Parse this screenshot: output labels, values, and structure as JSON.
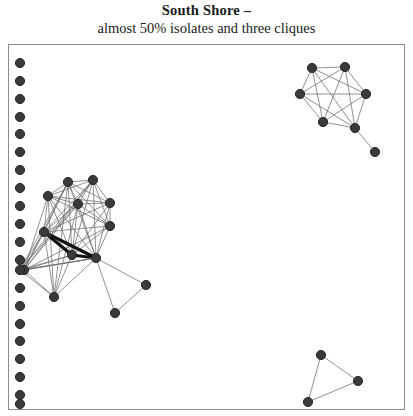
{
  "title": {
    "main": "South Shore –",
    "sub": "almost 50% isolates and three cliques"
  },
  "style": {
    "node_fill": "#3a3a3a",
    "node_stroke": "#1c1c1c",
    "edge_color": "#6d6d6d",
    "edge_heavy_color": "#121212",
    "frame_color": "#8d8d8d",
    "background": "#ffffff",
    "node_radius": 4.6
  },
  "chart_data": {
    "type": "scatter",
    "title": "South Shore – almost 50% isolates and three cliques",
    "xlabel": "",
    "ylabel": "",
    "grid": false,
    "legend": "none",
    "xlim": [
      8,
      405
    ],
    "ylim": [
      44,
      410
    ],
    "groups": [
      {
        "name": "isolates",
        "count": 20
      },
      {
        "name": "main-cluster",
        "count": 14
      },
      {
        "name": "top-right-clique",
        "count": 7
      },
      {
        "name": "bottom-right-clique",
        "count": 3
      }
    ],
    "nodes": [
      {
        "id": "i1",
        "x": 20,
        "y": 63,
        "group": "isolates"
      },
      {
        "id": "i2",
        "x": 20,
        "y": 81,
        "group": "isolates"
      },
      {
        "id": "i3",
        "x": 20,
        "y": 99,
        "group": "isolates"
      },
      {
        "id": "i4",
        "x": 20,
        "y": 117,
        "group": "isolates"
      },
      {
        "id": "i5",
        "x": 20,
        "y": 134,
        "group": "isolates"
      },
      {
        "id": "i6",
        "x": 20,
        "y": 152,
        "group": "isolates"
      },
      {
        "id": "i7",
        "x": 20,
        "y": 170,
        "group": "isolates"
      },
      {
        "id": "i8",
        "x": 20,
        "y": 188,
        "group": "isolates"
      },
      {
        "id": "i9",
        "x": 20,
        "y": 206,
        "group": "isolates"
      },
      {
        "id": "i10",
        "x": 20,
        "y": 224,
        "group": "isolates"
      },
      {
        "id": "i11",
        "x": 20,
        "y": 242,
        "group": "isolates"
      },
      {
        "id": "i12",
        "x": 20,
        "y": 260,
        "group": "isolates"
      },
      {
        "id": "i13",
        "x": 20,
        "y": 288,
        "group": "isolates"
      },
      {
        "id": "i14",
        "x": 20,
        "y": 306,
        "group": "isolates"
      },
      {
        "id": "i15",
        "x": 20,
        "y": 324,
        "group": "isolates"
      },
      {
        "id": "i16",
        "x": 20,
        "y": 341,
        "group": "isolates"
      },
      {
        "id": "i17",
        "x": 20,
        "y": 359,
        "group": "isolates"
      },
      {
        "id": "i18",
        "x": 20,
        "y": 377,
        "group": "isolates"
      },
      {
        "id": "i19",
        "x": 20,
        "y": 395,
        "group": "isolates"
      },
      {
        "id": "i20",
        "x": 20,
        "y": 404,
        "group": "isolates"
      },
      {
        "id": "c1",
        "x": 68,
        "y": 182,
        "group": "main-cluster"
      },
      {
        "id": "c2",
        "x": 93,
        "y": 180,
        "group": "main-cluster"
      },
      {
        "id": "c3",
        "x": 48,
        "y": 196,
        "group": "main-cluster"
      },
      {
        "id": "c4",
        "x": 78,
        "y": 204,
        "group": "main-cluster"
      },
      {
        "id": "c5",
        "x": 110,
        "y": 203,
        "group": "main-cluster"
      },
      {
        "id": "c6",
        "x": 110,
        "y": 226,
        "group": "main-cluster"
      },
      {
        "id": "c7",
        "x": 44,
        "y": 232,
        "group": "main-cluster"
      },
      {
        "id": "c8",
        "x": 72,
        "y": 255,
        "group": "main-cluster"
      },
      {
        "id": "c9",
        "x": 96,
        "y": 258,
        "group": "main-cluster"
      },
      {
        "id": "c10",
        "x": 24,
        "y": 270,
        "group": "main-cluster"
      },
      {
        "id": "c11",
        "x": 54,
        "y": 297,
        "group": "main-cluster"
      },
      {
        "id": "c12",
        "x": 146,
        "y": 285,
        "group": "main-cluster"
      },
      {
        "id": "c13",
        "x": 115,
        "y": 313,
        "group": "main-cluster"
      },
      {
        "id": "c14",
        "x": 20,
        "y": 270,
        "group": "main-cluster"
      },
      {
        "id": "t1",
        "x": 312,
        "y": 68,
        "group": "top-right-clique"
      },
      {
        "id": "t2",
        "x": 345,
        "y": 67,
        "group": "top-right-clique"
      },
      {
        "id": "t3",
        "x": 300,
        "y": 94,
        "group": "top-right-clique"
      },
      {
        "id": "t4",
        "x": 366,
        "y": 94,
        "group": "top-right-clique"
      },
      {
        "id": "t5",
        "x": 323,
        "y": 122,
        "group": "top-right-clique"
      },
      {
        "id": "t6",
        "x": 355,
        "y": 128,
        "group": "top-right-clique"
      },
      {
        "id": "t7",
        "x": 375,
        "y": 152,
        "group": "top-right-clique"
      },
      {
        "id": "b1",
        "x": 321,
        "y": 355,
        "group": "bottom-right-clique"
      },
      {
        "id": "b2",
        "x": 358,
        "y": 381,
        "group": "bottom-right-clique"
      },
      {
        "id": "b3",
        "x": 308,
        "y": 402,
        "group": "bottom-right-clique"
      }
    ],
    "edges": [
      [
        "c1",
        "c2",
        1
      ],
      [
        "c1",
        "c3",
        1
      ],
      [
        "c1",
        "c4",
        1
      ],
      [
        "c1",
        "c5",
        1
      ],
      [
        "c1",
        "c6",
        1
      ],
      [
        "c1",
        "c7",
        1
      ],
      [
        "c1",
        "c8",
        1
      ],
      [
        "c1",
        "c9",
        1
      ],
      [
        "c1",
        "c10",
        1
      ],
      [
        "c1",
        "c11",
        1
      ],
      [
        "c2",
        "c3",
        1
      ],
      [
        "c2",
        "c4",
        1
      ],
      [
        "c2",
        "c5",
        1
      ],
      [
        "c2",
        "c6",
        1
      ],
      [
        "c2",
        "c7",
        1
      ],
      [
        "c2",
        "c8",
        1
      ],
      [
        "c2",
        "c9",
        1
      ],
      [
        "c2",
        "c10",
        1
      ],
      [
        "c3",
        "c4",
        1
      ],
      [
        "c3",
        "c5",
        1
      ],
      [
        "c3",
        "c6",
        1
      ],
      [
        "c3",
        "c7",
        1
      ],
      [
        "c3",
        "c8",
        1
      ],
      [
        "c3",
        "c9",
        1
      ],
      [
        "c3",
        "c10",
        1
      ],
      [
        "c3",
        "c11",
        1
      ],
      [
        "c4",
        "c5",
        1
      ],
      [
        "c4",
        "c6",
        1
      ],
      [
        "c4",
        "c7",
        1
      ],
      [
        "c4",
        "c8",
        1
      ],
      [
        "c4",
        "c9",
        1
      ],
      [
        "c4",
        "c10",
        1
      ],
      [
        "c4",
        "c11",
        1
      ],
      [
        "c5",
        "c6",
        1
      ],
      [
        "c5",
        "c7",
        1
      ],
      [
        "c5",
        "c8",
        1
      ],
      [
        "c5",
        "c9",
        1
      ],
      [
        "c6",
        "c7",
        1
      ],
      [
        "c6",
        "c8",
        1
      ],
      [
        "c6",
        "c9",
        1
      ],
      [
        "c6",
        "c10",
        1
      ],
      [
        "c7",
        "c8",
        3
      ],
      [
        "c7",
        "c9",
        3
      ],
      [
        "c7",
        "c10",
        1
      ],
      [
        "c7",
        "c11",
        1
      ],
      [
        "c8",
        "c9",
        3
      ],
      [
        "c8",
        "c10",
        1
      ],
      [
        "c8",
        "c11",
        1
      ],
      [
        "c9",
        "c10",
        1
      ],
      [
        "c9",
        "c11",
        1
      ],
      [
        "c9",
        "c12",
        1
      ],
      [
        "c9",
        "c13",
        1
      ],
      [
        "c10",
        "c11",
        1
      ],
      [
        "c10",
        "c9",
        1
      ],
      [
        "c12",
        "c13",
        1
      ],
      [
        "c14",
        "c1",
        1
      ],
      [
        "c14",
        "c2",
        1
      ],
      [
        "c14",
        "c4",
        1
      ],
      [
        "c14",
        "c7",
        1
      ],
      [
        "c14",
        "c8",
        1
      ],
      [
        "c14",
        "c9",
        1
      ],
      [
        "c14",
        "c11",
        1
      ],
      [
        "t1",
        "t2",
        1
      ],
      [
        "t1",
        "t3",
        1
      ],
      [
        "t1",
        "t4",
        1
      ],
      [
        "t1",
        "t5",
        1
      ],
      [
        "t1",
        "t6",
        1
      ],
      [
        "t2",
        "t3",
        1
      ],
      [
        "t2",
        "t4",
        1
      ],
      [
        "t2",
        "t5",
        1
      ],
      [
        "t2",
        "t6",
        1
      ],
      [
        "t3",
        "t4",
        1
      ],
      [
        "t3",
        "t5",
        1
      ],
      [
        "t3",
        "t6",
        1
      ],
      [
        "t4",
        "t5",
        1
      ],
      [
        "t4",
        "t6",
        1
      ],
      [
        "t5",
        "t6",
        1
      ],
      [
        "t6",
        "t7",
        1
      ],
      [
        "b1",
        "b2",
        1
      ],
      [
        "b1",
        "b3",
        1
      ],
      [
        "b2",
        "b3",
        1
      ]
    ]
  }
}
